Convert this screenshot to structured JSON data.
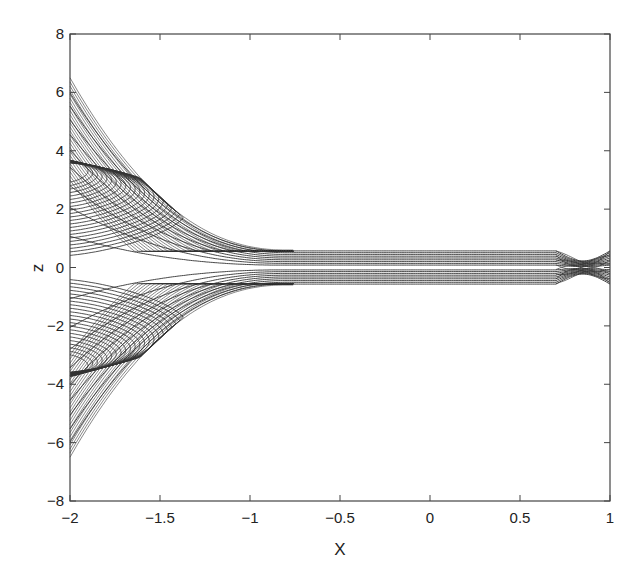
{
  "chart_data": {
    "type": "contour",
    "title": "",
    "xlabel": "X",
    "ylabel": "z",
    "xlim": [
      -2,
      1
    ],
    "ylim": [
      -8,
      8
    ],
    "xticks": [
      -2,
      -1.5,
      -1,
      -0.5,
      0,
      0.5,
      1
    ],
    "xtick_labels": [
      "-2",
      "-1.5",
      "-1",
      "-0.5",
      "0",
      "0.5",
      "1"
    ],
    "yticks": [
      -8,
      -6,
      -4,
      -2,
      0,
      2,
      4,
      6,
      8
    ],
    "ytick_labels": [
      "-8",
      "-6",
      "-4",
      "-2",
      "0",
      "2",
      "4",
      "6",
      "8"
    ],
    "grid": false,
    "legend": null,
    "line_color": "#333333",
    "features": {
      "saddle_point": {
        "x": -1.3,
        "z": 0.0
      },
      "upper_envelope": [
        [
          -2,
          6.5
        ],
        [
          -1.5,
          3.2
        ],
        [
          -1.2,
          1.4
        ],
        [
          -1.0,
          0.8
        ],
        [
          -0.8,
          0.6
        ]
      ],
      "lower_envelope": [
        [
          -2,
          -6.5
        ],
        [
          -1.5,
          -3.2
        ],
        [
          -1.2,
          -1.4
        ],
        [
          -1.0,
          -0.8
        ],
        [
          -0.8,
          -0.6
        ]
      ],
      "band": {
        "x_start": -0.8,
        "x_end": 0.7,
        "z_min": -0.5,
        "z_max": 0.6
      },
      "right_bulge": {
        "x_start": 0.7,
        "x_end": 1.0,
        "z_min": -0.6,
        "z_max": 0.6
      }
    }
  },
  "axes": {
    "x_label": "X",
    "y_label": "z"
  }
}
